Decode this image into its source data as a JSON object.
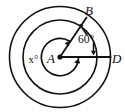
{
  "figure": {
    "type": "geometry-diagram",
    "stroke_color": "#111111",
    "background_color": "#ffffff",
    "labels": {
      "center": "A",
      "point_b": "B",
      "point_d": "D",
      "angle_known": "60°",
      "angle_unknown": "x°"
    },
    "values": {
      "angle_known_degrees": 60,
      "angle_unknown_label": "x"
    }
  }
}
